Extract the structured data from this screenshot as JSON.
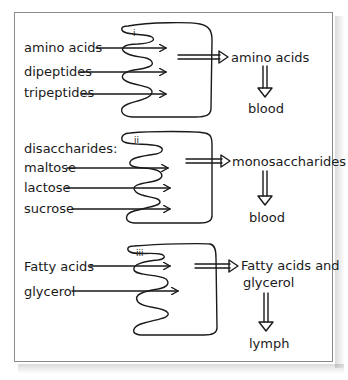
{
  "diagram": {
    "type": "absorption-of-digestion-products",
    "panels": [
      {
        "id": "i",
        "label": "i",
        "inputs": [
          "amino acids",
          "dipeptides",
          "tripeptides"
        ],
        "input_heading": "",
        "output": "amino acids",
        "output_line2": "",
        "destination": "blood"
      },
      {
        "id": "ii",
        "label": "ii",
        "input_heading": "disaccharides:",
        "inputs": [
          "maltose",
          "lactose",
          "sucrose"
        ],
        "output": "monosaccharides",
        "output_line2": "",
        "destination": "blood"
      },
      {
        "id": "iii",
        "label": "iii",
        "input_heading": "",
        "inputs": [
          "Fatty acids",
          "glycerol"
        ],
        "output": "Fatty acids and",
        "output_line2": "glycerol",
        "destination": "lymph"
      }
    ]
  },
  "colors": {
    "ink": "#1a1a1a",
    "frame": "#8a8a8a",
    "background": "#ffffff"
  }
}
